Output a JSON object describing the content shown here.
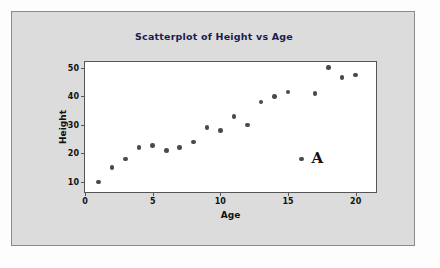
{
  "figure": {
    "background_color": "#dcdcdc",
    "border_color": "#8a8a8a",
    "plot_background_color": "#ffffff",
    "title_color": "#1c1c4e",
    "marker_color": "#4a4a4a"
  },
  "annotation": {
    "label": "A"
  },
  "chart_data": {
    "type": "scatter",
    "title": "Scatterplot of Height vs Age",
    "xlabel": "Age",
    "ylabel": "Height",
    "xlim": [
      0,
      21.5
    ],
    "ylim": [
      6.5,
      52
    ],
    "xticks": [
      0,
      5,
      10,
      15,
      20
    ],
    "yticks": [
      10,
      20,
      30,
      40,
      50
    ],
    "xtick_labels": [
      "0",
      "5",
      "10",
      "15",
      "20"
    ],
    "ytick_labels": [
      "10",
      "20",
      "30",
      "40",
      "50"
    ],
    "grid": false,
    "legend": null,
    "series": [
      {
        "name": "Height vs Age",
        "x": [
          1,
          2,
          3,
          4,
          5,
          6,
          7,
          8,
          9,
          10,
          11,
          12,
          13,
          14,
          15,
          16,
          17,
          18,
          19,
          20
        ],
        "y": [
          10,
          15,
          18,
          22,
          22.7,
          21,
          22,
          24,
          29,
          28,
          33,
          30,
          38,
          40,
          41.5,
          18,
          41,
          50,
          46.5,
          47.5
        ]
      }
    ],
    "annotations": [
      {
        "text": "A",
        "x": 16,
        "y": 18,
        "note": "outlier point labelled A"
      }
    ]
  }
}
